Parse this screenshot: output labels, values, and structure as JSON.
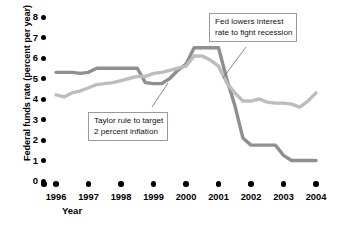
{
  "chart_data": {
    "type": "line",
    "title": "",
    "xlabel": "Year",
    "ylabel": "Federal funds rate (percent per year)",
    "xlim": [
      1996,
      2004
    ],
    "ylim": [
      0,
      8
    ],
    "grid": false,
    "legend_position": "none",
    "x_tick_labels": [
      "1996",
      "1997",
      "1998",
      "1999",
      "2000",
      "2001",
      "2002",
      "2003",
      "2004"
    ],
    "y_tick_labels": [
      "0",
      "1",
      "2",
      "3",
      "4",
      "5",
      "6",
      "7",
      "8"
    ],
    "series": [
      {
        "name": "Federal funds rate",
        "color": "#8f8f8f",
        "x": [
          1996.0,
          1996.25,
          1996.5,
          1996.75,
          1997.0,
          1997.25,
          1997.5,
          1997.75,
          1998.0,
          1998.25,
          1998.5,
          1998.75,
          1999.0,
          1999.25,
          1999.5,
          1999.75,
          2000.0,
          2000.25,
          2000.5,
          2000.75,
          2001.0,
          2001.25,
          2001.5,
          2001.75,
          2002.0,
          2002.25,
          2002.5,
          2002.75,
          2003.0,
          2003.25,
          2003.5,
          2003.75,
          2004.0
        ],
        "values": [
          5.3,
          5.3,
          5.3,
          5.25,
          5.3,
          5.5,
          5.5,
          5.5,
          5.5,
          5.5,
          5.5,
          4.8,
          4.75,
          4.75,
          5.0,
          5.4,
          5.7,
          6.5,
          6.5,
          6.5,
          6.5,
          5.0,
          3.7,
          2.1,
          1.75,
          1.75,
          1.75,
          1.75,
          1.25,
          1.0,
          1.0,
          1.0,
          1.0
        ]
      },
      {
        "name": "Taylor rule rate",
        "color": "#bdbdbd",
        "x": [
          1996.0,
          1996.25,
          1996.5,
          1996.75,
          1997.0,
          1997.25,
          1997.5,
          1997.75,
          1998.0,
          1998.25,
          1998.5,
          1998.75,
          1999.0,
          1999.25,
          1999.5,
          1999.75,
          2000.0,
          2000.25,
          2000.5,
          2000.75,
          2001.0,
          2001.25,
          2001.5,
          2001.75,
          2002.0,
          2002.25,
          2002.5,
          2002.75,
          2003.0,
          2003.25,
          2003.5,
          2003.75,
          2004.0
        ],
        "values": [
          4.2,
          4.1,
          4.3,
          4.4,
          4.55,
          4.7,
          4.75,
          4.8,
          4.9,
          5.0,
          5.1,
          5.1,
          5.25,
          5.3,
          5.4,
          5.5,
          5.6,
          6.1,
          6.1,
          5.9,
          5.6,
          4.8,
          4.3,
          3.9,
          3.9,
          4.0,
          3.85,
          3.8,
          3.8,
          3.75,
          3.6,
          3.9,
          4.3
        ]
      }
    ],
    "annotations": [
      {
        "id": "fed-lowers",
        "text_line1": "Fed lowers interest",
        "text_line2": "rate to fight recession"
      },
      {
        "id": "taylor-rule",
        "text_line1": "Taylor rule to target",
        "text_line2": "2 percent inflation"
      }
    ]
  }
}
